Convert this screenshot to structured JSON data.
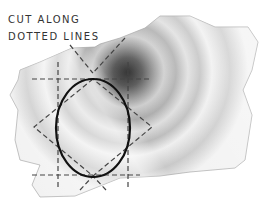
{
  "caption": {
    "line1": "Cut along",
    "line2": "dotted lines"
  },
  "figure": {
    "line_color": "#111111",
    "dash_color": "#444444"
  }
}
